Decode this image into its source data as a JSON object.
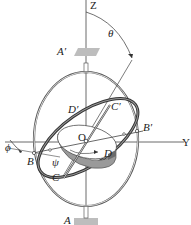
{
  "diagram": {
    "type": "gyroscope-euler-angles",
    "labels": {
      "z_axis": "Z",
      "y_axis": "Y",
      "theta": "θ",
      "phi": "ϕ",
      "psi": "ψ",
      "origin": "O",
      "A_prime": "A′",
      "A": "A",
      "B": "B",
      "B_prime": "B′",
      "C": "C",
      "C_prime": "C′",
      "D": "D",
      "D_prime": "D′"
    },
    "colors": {
      "line": "#333333",
      "ring": "#555555",
      "rotor_fill": "#9a9a9a",
      "rotor_dark": "#6b6b6b",
      "bearing": "#bdbdbd"
    }
  }
}
